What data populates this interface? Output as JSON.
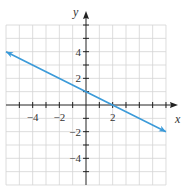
{
  "chart_data": {
    "type": "line",
    "title": "",
    "xlabel": "x",
    "ylabel": "y",
    "xlim": [
      -6,
      6
    ],
    "ylim": [
      -6,
      6
    ],
    "grid": true,
    "x_tick_labels": [
      "-4",
      "-2",
      "2"
    ],
    "y_tick_labels": [
      "4",
      "2",
      "-2",
      "-4"
    ],
    "series": [
      {
        "name": "y = -x/2 + 1",
        "x": [
          -6,
          0,
          2,
          6
        ],
        "y": [
          4,
          1,
          0,
          -2
        ],
        "arrows": "both",
        "color": "#3a9ad9"
      }
    ]
  },
  "labels": {
    "x_axis": "x",
    "y_axis": "y",
    "xticks": [
      {
        "value": -4,
        "text": "−4"
      },
      {
        "value": -2,
        "text": "−2"
      },
      {
        "value": 2,
        "text": "2"
      }
    ],
    "yticks": [
      {
        "value": 4,
        "text": "4"
      },
      {
        "value": 2,
        "text": "2"
      },
      {
        "value": -2,
        "text": "−2"
      },
      {
        "value": -4,
        "text": "−4"
      }
    ]
  },
  "colors": {
    "grid": "#d4d4d4",
    "axis": "#222222",
    "line": "#3a9ad9"
  }
}
